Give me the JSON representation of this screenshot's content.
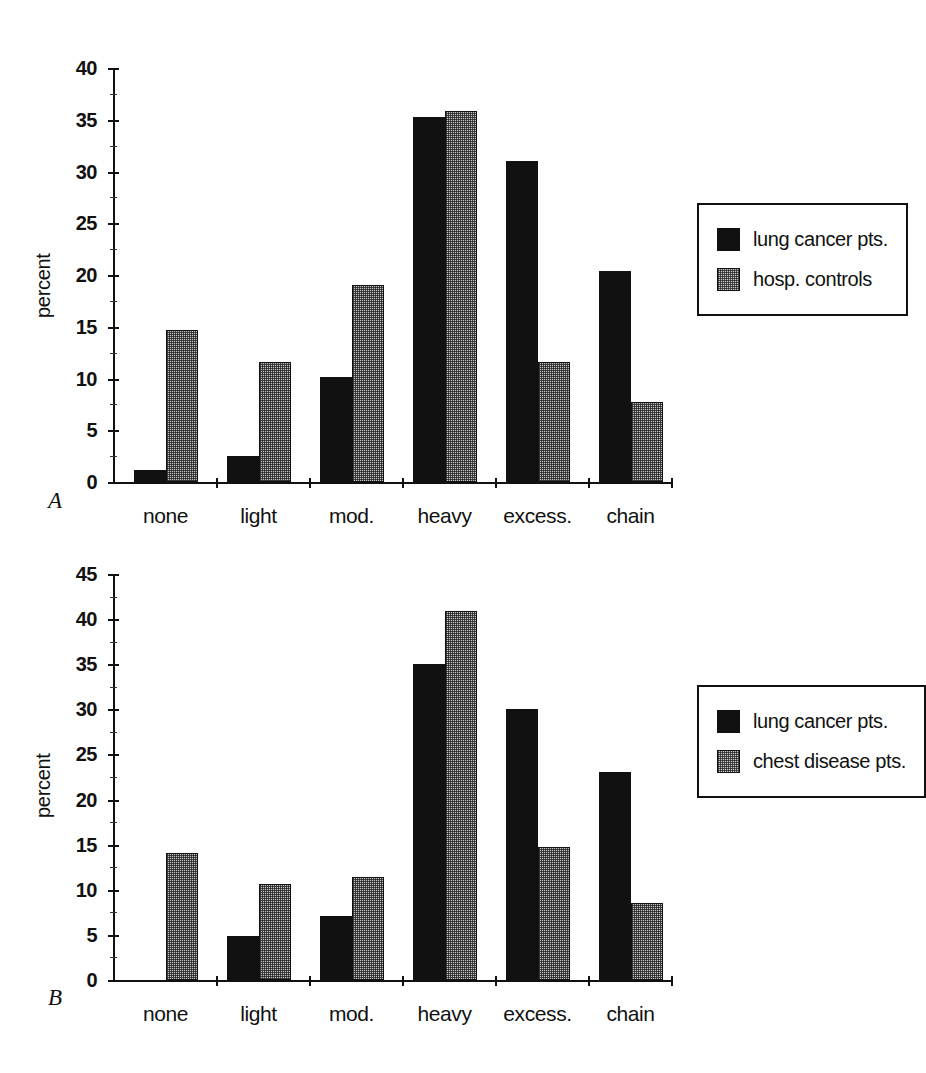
{
  "figure": {
    "panels": [
      {
        "letter": "A",
        "ylabel": "percent",
        "legend": [
          "lung cancer pts.",
          "hosp. controls"
        ]
      },
      {
        "letter": "B",
        "ylabel": "percent",
        "legend": [
          "lung cancer pts.",
          "chest disease pts."
        ]
      }
    ],
    "colors": {
      "series1": "#111111",
      "series2": "#c9c9c9",
      "axis": "#111111",
      "background": "#ffffff"
    }
  },
  "chart_data": [
    {
      "type": "bar",
      "panel": "A",
      "title": "",
      "xlabel": "",
      "ylabel": "percent",
      "categories": [
        "none",
        "light",
        "mod.",
        "heavy",
        "excess.",
        "chain"
      ],
      "series": [
        {
          "name": "lung cancer pts.",
          "values": [
            1.2,
            2.5,
            10.1,
            35.3,
            31.0,
            20.4
          ]
        },
        {
          "name": "hosp. controls",
          "values": [
            14.7,
            11.6,
            19.0,
            35.8,
            11.6,
            7.7
          ]
        }
      ],
      "ylim": [
        0,
        40
      ],
      "yticks": [
        0,
        5,
        10,
        15,
        20,
        25,
        30,
        35,
        40
      ],
      "yticklabels": [
        "0",
        "5",
        "10",
        "15",
        "20",
        "25",
        "30",
        "35",
        "40"
      ],
      "grid": false,
      "legend_position": "right"
    },
    {
      "type": "bar",
      "panel": "B",
      "title": "",
      "xlabel": "",
      "ylabel": "percent",
      "categories": [
        "none",
        "light",
        "mod.",
        "heavy",
        "excess.",
        "chain"
      ],
      "series": [
        {
          "name": "lung cancer pts.",
          "values": [
            0,
            4.9,
            7.1,
            35.0,
            30.0,
            23.1
          ]
        },
        {
          "name": "chest disease pts.",
          "values": [
            14.1,
            10.6,
            11.4,
            40.9,
            14.7,
            8.5
          ]
        }
      ],
      "ylim": [
        0,
        45
      ],
      "yticks": [
        0,
        5,
        10,
        15,
        20,
        25,
        30,
        35,
        40,
        45
      ],
      "yticklabels": [
        "0",
        "5",
        "10",
        "15",
        "20",
        "25",
        "30",
        "35",
        "40",
        "45"
      ],
      "grid": false,
      "legend_position": "right"
    }
  ]
}
